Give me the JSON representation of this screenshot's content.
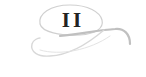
{
  "ornament": {
    "numeral": "II",
    "icon": "swirl-flourish-icon",
    "colors": {
      "numeral": "#222222",
      "swirl": "#c8c8c8",
      "swirl_light": "#e0e0e0",
      "background": "#ffffff"
    }
  }
}
